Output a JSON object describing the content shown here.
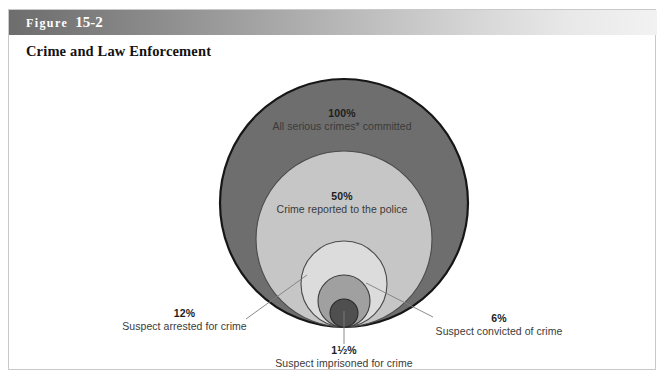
{
  "figure": {
    "banner_word": "Figure",
    "banner_number": "15-2",
    "subtitle": "Crime and Law Enforcement"
  },
  "colors": {
    "banner_gradient_start": "#6d6d6d",
    "banner_gradient_end": "#f2f2f2",
    "banner_text": "#ffffff",
    "box_border": "#c9c9c9",
    "page_background": "#ffffff",
    "ring_100": "#6e6e6e",
    "ring_50": "#c6c6c6",
    "ring_12": "#dcdcdc",
    "ring_6": "#a0a0a0",
    "ring_1_5": "#4f4f4f",
    "circle_outline": "#1a1a1a",
    "leader_line": "#7a7a7a",
    "label_text": "#2b2b2b"
  },
  "chart_data": {
    "type": "pie",
    "title": "Crime and Law Enforcement",
    "subtype": "nested-proportional-circles",
    "note": "Bottom-tangent nested circles showing attrition of serious crimes through the criminal justice system",
    "xlabel": "",
    "ylabel": "",
    "categories": [
      "All serious crimes* committed",
      "Crime reported to the police",
      "Suspect arrested for crime",
      "Suspect convicted of crime",
      "Suspect imprisoned for crime"
    ],
    "values": [
      100,
      50,
      12,
      6,
      1.5
    ],
    "value_labels": [
      "100%",
      "50%",
      "12%",
      "6%",
      "1½%"
    ],
    "series": [
      {
        "name": "Share of serious crimes",
        "values": [
          100,
          50,
          12,
          6,
          1.5
        ]
      }
    ],
    "legend_position": "inline-annotations",
    "grid": false
  },
  "circles": [
    {
      "id": "circle-100",
      "percent_label": "100%",
      "description": "All serious crimes* committed",
      "fill": "#6e6e6e",
      "cx": 335,
      "cy": 141,
      "r": 124
    },
    {
      "id": "circle-50",
      "percent_label": "50%",
      "description": "Crime reported to the police",
      "fill": "#c6c6c6",
      "cx": 335,
      "cy": 177,
      "r": 88
    },
    {
      "id": "circle-12",
      "percent_label": "12%",
      "description": "Suspect arrested for crime",
      "fill": "#dcdcdc",
      "cx": 335,
      "cy": 222,
      "r": 43
    },
    {
      "id": "circle-6",
      "percent_label": "6%",
      "description": "Suspect convicted of crime",
      "fill": "#a0a0a0",
      "cx": 335,
      "cy": 239,
      "r": 26
    },
    {
      "id": "circle-1-5",
      "percent_label": "1½%",
      "description": "Suspect imprisoned for crime",
      "fill": "#4f4f4f",
      "cx": 335,
      "cy": 251,
      "r": 14
    }
  ],
  "labels": {
    "pct_100": "100%",
    "desc_100": "All serious crimes* committed",
    "pct_50": "50%",
    "desc_50": "Crime reported to the police",
    "pct_12": "12%",
    "desc_12": "Suspect arrested for crime",
    "pct_6": "6%",
    "desc_6": "Suspect convicted of crime",
    "pct_1_5_whole": "1",
    "pct_1_5_num": "1",
    "pct_1_5_den": "2",
    "pct_1_5_suffix": "%",
    "desc_1_5": "Suspect imprisoned for crime"
  }
}
